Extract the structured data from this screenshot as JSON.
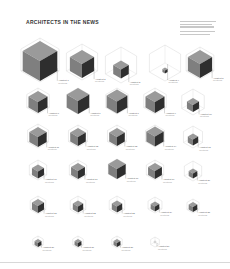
{
  "title": "ARCHITECTS IN THE NEWS",
  "legend": {
    "lines": 5,
    "note": "small legend text, illegible at this resolution"
  },
  "colors": {
    "cube_top": "#9a9a9a",
    "cube_left": "#7f7f7f",
    "cube_right": "#2e2e2e",
    "hex_outline": "#cfcfcf",
    "label": "#555555"
  },
  "cells": [
    {
      "x": 40,
      "y": 60,
      "hex": 22,
      "cube": 20,
      "label": "Architect 1",
      "sub": "mentions"
    },
    {
      "x": 82,
      "y": 62,
      "hex": 18,
      "cube": 14,
      "label": "Architect 2",
      "sub": "mentions"
    },
    {
      "x": 121,
      "y": 65,
      "hex": 18,
      "cube": 9,
      "label": "Architect 3",
      "sub": "mentions"
    },
    {
      "x": 165,
      "y": 63,
      "hex": 18,
      "cube": 3,
      "label": "Architect 4",
      "sub": "mentions"
    },
    {
      "x": 200,
      "y": 63,
      "hex": 16,
      "cube": 14,
      "label": "Architect 5",
      "sub": "mentions"
    },
    {
      "x": 38,
      "y": 101,
      "hex": 13,
      "cube": 11,
      "label": "Architect 6",
      "sub": "mentions"
    },
    {
      "x": 78,
      "y": 101,
      "hex": 13,
      "cube": 13,
      "label": "Architect 7",
      "sub": "mentions"
    },
    {
      "x": 117,
      "y": 101,
      "hex": 13,
      "cube": 12,
      "label": "Architect 8",
      "sub": "mentions"
    },
    {
      "x": 155,
      "y": 101,
      "hex": 13,
      "cube": 11,
      "label": "Architect 9",
      "sub": "mentions"
    },
    {
      "x": 193,
      "y": 102,
      "hex": 13,
      "cube": 7,
      "label": "Architect 10",
      "sub": "mentions"
    },
    {
      "x": 38,
      "y": 136,
      "hex": 12,
      "cube": 10,
      "label": "Architect 11",
      "sub": "mentions"
    },
    {
      "x": 78,
      "y": 136,
      "hex": 11,
      "cube": 9,
      "label": "Architect 12",
      "sub": "mentions"
    },
    {
      "x": 117,
      "y": 136,
      "hex": 11,
      "cube": 9,
      "label": "Architect 13",
      "sub": "mentions"
    },
    {
      "x": 155,
      "y": 136,
      "hex": 11,
      "cube": 10,
      "label": "Architect 14",
      "sub": "mentions"
    },
    {
      "x": 193,
      "y": 137,
      "hex": 11,
      "cube": 6,
      "label": "Architect 15",
      "sub": "mentions"
    },
    {
      "x": 38,
      "y": 170,
      "hex": 10,
      "cube": 7,
      "label": "Architect 16",
      "sub": "mentions"
    },
    {
      "x": 78,
      "y": 170,
      "hex": 10,
      "cube": 8,
      "label": "Architect 17",
      "sub": "mentions"
    },
    {
      "x": 117,
      "y": 169,
      "hex": 10,
      "cube": 10,
      "label": "Architect 18",
      "sub": "mentions"
    },
    {
      "x": 155,
      "y": 170,
      "hex": 10,
      "cube": 8,
      "label": "Architect 19",
      "sub": "mentions"
    },
    {
      "x": 193,
      "y": 171,
      "hex": 10,
      "cube": 5,
      "label": "Architect 20",
      "sub": "mentions"
    },
    {
      "x": 38,
      "y": 205,
      "hex": 9,
      "cube": 7,
      "label": "Architect 21",
      "sub": "mentions"
    },
    {
      "x": 78,
      "y": 205,
      "hex": 9,
      "cube": 6,
      "label": "Architect 22",
      "sub": "mentions"
    },
    {
      "x": 117,
      "y": 205,
      "hex": 9,
      "cube": 6,
      "label": "Architect 23",
      "sub": "mentions"
    },
    {
      "x": 155,
      "y": 205,
      "hex": 8,
      "cube": 5,
      "label": "Architect 24",
      "sub": "mentions"
    },
    {
      "x": 193,
      "y": 206,
      "hex": 7,
      "cube": 5,
      "label": "Architect 25",
      "sub": "mentions"
    },
    {
      "x": 38,
      "y": 242,
      "hex": 6,
      "cube": 4,
      "label": "Architect 26",
      "sub": "mentions"
    },
    {
      "x": 78,
      "y": 242,
      "hex": 6,
      "cube": 4,
      "label": "Architect 27",
      "sub": "mentions"
    },
    {
      "x": 117,
      "y": 242,
      "hex": 6,
      "cube": 4,
      "label": "Architect 28",
      "sub": "mentions"
    },
    {
      "x": 155,
      "y": 242,
      "hex": 5,
      "cube": 0,
      "label": "Architect 29",
      "sub": "mentions"
    }
  ]
}
